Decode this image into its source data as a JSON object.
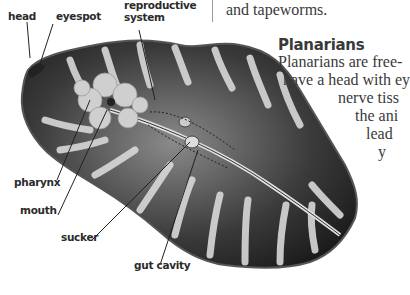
{
  "page": {
    "intro_fragment": "and tapeworms.",
    "section": {
      "heading": "Planarians",
      "lines": [
        "Planarians are free-",
        "have a head with ey",
        "nerve tiss",
        "the ani",
        "lead",
        "y"
      ]
    }
  },
  "figure": {
    "labels": {
      "head": "head",
      "eyespot": "eyespot",
      "reproductive_system_1": "reproductive",
      "reproductive_system_2": "system",
      "pharynx": "pharynx",
      "mouth": "mouth",
      "sucker": "sucker",
      "gut_cavity": "gut cavity"
    }
  },
  "colors": {
    "text": "#3a3a3a",
    "body_dark": "#1a1a1a",
    "body_light": "#d8d8d8"
  }
}
